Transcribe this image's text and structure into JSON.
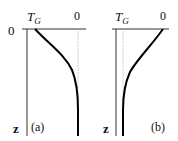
{
  "figure": {
    "panels": [
      {
        "id": "a",
        "label": "(a)",
        "x_label_left": "T",
        "x_label_left_sub": "G",
        "x_label_right": "0",
        "y_origin_label": "0",
        "y_axis_label": "z",
        "curve_description": "Starts at T_G at surface (z=0), increases with depth and asymptotically approaches 0"
      },
      {
        "id": "b",
        "label": "(b)",
        "x_label_left": "T",
        "x_label_left_sub": "G",
        "x_label_right": "0",
        "y_axis_label": "z",
        "curve_description": "Starts at 0 at surface (z=0), decreases with depth and asymptotically approaches T_G"
      }
    ],
    "colors": {
      "axis": "#333333",
      "curve": "#000000",
      "dotted_guide": "#aaaaaa",
      "text": "#111111"
    }
  }
}
